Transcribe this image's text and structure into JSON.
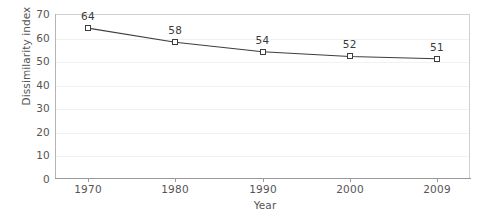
{
  "chart_data": {
    "type": "line",
    "title": "",
    "subtitle": "",
    "xlabel": "Year",
    "ylabel": "Dissimilarity index",
    "categories": [
      "1970",
      "1980",
      "1990",
      "2000",
      "2009"
    ],
    "values": [
      64,
      58,
      54,
      52,
      51
    ],
    "point_labels": [
      "64",
      "58",
      "54",
      "52",
      "51"
    ],
    "ylim": [
      0,
      70
    ],
    "y_ticks": [
      "0",
      "10",
      "20",
      "30",
      "40",
      "50",
      "60",
      "70"
    ],
    "y_tick_values": [
      0,
      10,
      20,
      30,
      40,
      50,
      60,
      70
    ],
    "grid": "horizontal-faint",
    "legend": "none",
    "series": [
      {
        "name": "Dissimilarity index",
        "values": [
          64,
          58,
          54,
          52,
          51
        ],
        "marker": "open-square",
        "line_color": "#3d3d3d",
        "marker_fill": "#ffffff",
        "marker_edge": "#3d3d3d"
      }
    ],
    "colors": {
      "line": "#3d3d3d",
      "axis": "#9a9a9a",
      "plot_border": "#d0d0d0",
      "gridline": "#f2f2f2",
      "text": "#555555",
      "label_text": "#3a3a3a",
      "background": "#ffffff"
    }
  }
}
